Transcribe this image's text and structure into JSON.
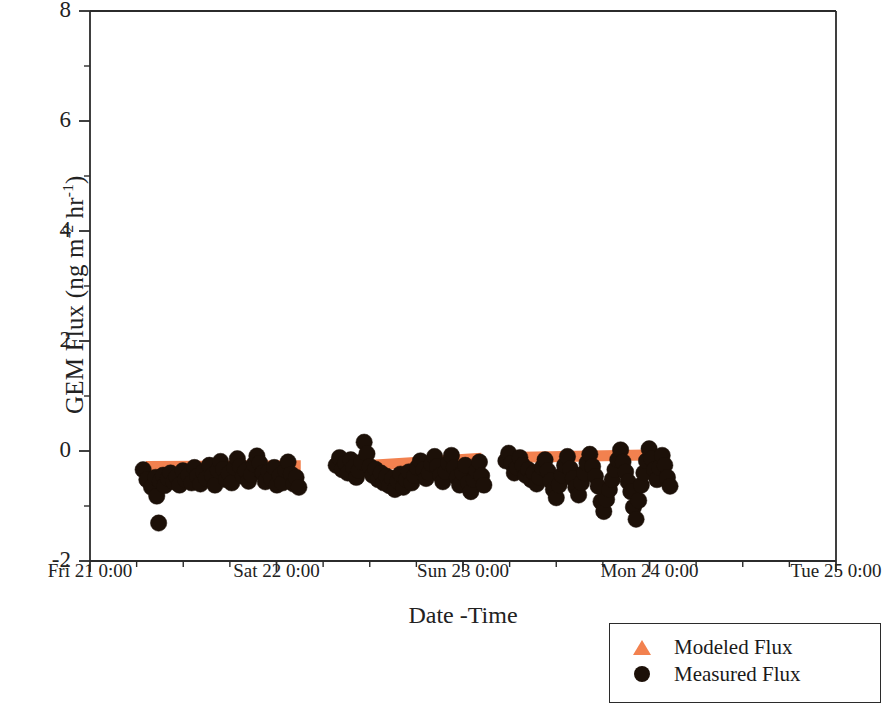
{
  "chart_data": {
    "type": "scatter",
    "title": "",
    "xlabel": "Date -Time",
    "ylabel": "GEM Flux (ng m-2 hr-1)",
    "ylabel_parts": {
      "prefix": "GEM Flux (ng m",
      "sup1": "-2",
      "mid": " hr",
      "sup2": "-1",
      "suffix": ")"
    },
    "ylim": [
      -2,
      8
    ],
    "yticks": [
      8,
      6,
      4,
      2,
      0,
      -2
    ],
    "ytick_labels": [
      "8",
      "6",
      "4",
      "2",
      "0",
      "-2"
    ],
    "xlim": [
      0,
      4
    ],
    "xticks": [
      0,
      1,
      2,
      3,
      4
    ],
    "xtick_labels": [
      "Fri 21 0:00",
      "Sat 22 0:00",
      "Sun 23 0:00",
      "Mon 24 0:00",
      "Tue 25 0:00"
    ],
    "x_minor_ticks_per_interval": 4,
    "grid": false,
    "legend_position": "bottom-right",
    "colors": {
      "modeled": "#F2814F",
      "measured": "#1C1008",
      "axis": "#2b2b2b",
      "background": "#ffffff"
    },
    "series": [
      {
        "name": "Modeled Flux",
        "marker": "triangle",
        "color": "#F2814F",
        "style": "thick-band",
        "segments": [
          {
            "x": [
              0.3,
              1.13
            ],
            "y": [
              -0.28,
              -0.27
            ]
          },
          {
            "x": [
              1.32,
              2.1
            ],
            "y": [
              -0.3,
              -0.13
            ]
          },
          {
            "x": [
              2.23,
              3.05
            ],
            "y": [
              -0.12,
              -0.07
            ]
          }
        ]
      },
      {
        "name": "Measured Flux",
        "marker": "circle",
        "color": "#1C1008",
        "points": [
          [
            0.285,
            -0.34
          ],
          [
            0.305,
            -0.52
          ],
          [
            0.33,
            -0.66
          ],
          [
            0.352,
            -0.48
          ],
          [
            0.358,
            -0.82
          ],
          [
            0.375,
            -0.55
          ],
          [
            0.392,
            -0.44
          ],
          [
            0.4,
            -0.63
          ],
          [
            0.368,
            -1.31
          ],
          [
            0.418,
            -0.5
          ],
          [
            0.432,
            -0.4
          ],
          [
            0.448,
            -0.56
          ],
          [
            0.465,
            -0.47
          ],
          [
            0.48,
            -0.62
          ],
          [
            0.498,
            -0.36
          ],
          [
            0.512,
            -0.52
          ],
          [
            0.528,
            -0.44
          ],
          [
            0.545,
            -0.58
          ],
          [
            0.56,
            -0.3
          ],
          [
            0.575,
            -0.46
          ],
          [
            0.592,
            -0.6
          ],
          [
            0.608,
            -0.38
          ],
          [
            0.622,
            -0.5
          ],
          [
            0.64,
            -0.26
          ],
          [
            0.655,
            -0.45
          ],
          [
            0.67,
            -0.62
          ],
          [
            0.686,
            -0.35
          ],
          [
            0.7,
            -0.19
          ],
          [
            0.715,
            -0.33
          ],
          [
            0.73,
            -0.52
          ],
          [
            0.745,
            -0.41
          ],
          [
            0.76,
            -0.58
          ],
          [
            0.775,
            -0.3
          ],
          [
            0.79,
            -0.14
          ],
          [
            0.805,
            -0.28
          ],
          [
            0.82,
            -0.46
          ],
          [
            0.835,
            -0.36
          ],
          [
            0.85,
            -0.55
          ],
          [
            0.865,
            -0.43
          ],
          [
            0.88,
            -0.24
          ],
          [
            0.895,
            -0.09
          ],
          [
            0.91,
            -0.22
          ],
          [
            0.925,
            -0.4
          ],
          [
            0.94,
            -0.56
          ],
          [
            0.958,
            -0.38
          ],
          [
            0.972,
            -0.5
          ],
          [
            0.988,
            -0.3
          ],
          [
            1.002,
            -0.62
          ],
          [
            1.018,
            -0.45
          ],
          [
            1.032,
            -0.58
          ],
          [
            1.048,
            -0.35
          ],
          [
            1.062,
            -0.2
          ],
          [
            1.078,
            -0.42
          ],
          [
            1.092,
            -0.6
          ],
          [
            1.105,
            -0.48
          ],
          [
            1.12,
            -0.66
          ],
          [
            1.32,
            -0.26
          ],
          [
            1.338,
            -0.12
          ],
          [
            1.352,
            -0.34
          ],
          [
            1.368,
            -0.22
          ],
          [
            1.382,
            -0.4
          ],
          [
            1.398,
            -0.16
          ],
          [
            1.412,
            -0.3
          ],
          [
            1.428,
            -0.48
          ],
          [
            1.442,
            -0.36
          ],
          [
            1.456,
            -0.2
          ],
          [
            1.47,
            0.16
          ],
          [
            1.485,
            -0.05
          ],
          [
            1.5,
            -0.28
          ],
          [
            1.515,
            -0.44
          ],
          [
            1.53,
            -0.33
          ],
          [
            1.545,
            -0.52
          ],
          [
            1.56,
            -0.4
          ],
          [
            1.575,
            -0.58
          ],
          [
            1.59,
            -0.46
          ],
          [
            1.605,
            -0.63
          ],
          [
            1.62,
            -0.5
          ],
          [
            1.635,
            -0.7
          ],
          [
            1.65,
            -0.55
          ],
          [
            1.665,
            -0.42
          ],
          [
            1.68,
            -0.66
          ],
          [
            1.695,
            -0.52
          ],
          [
            1.71,
            -0.38
          ],
          [
            1.725,
            -0.58
          ],
          [
            1.74,
            -0.45
          ],
          [
            1.755,
            -0.3
          ],
          [
            1.772,
            -0.18
          ],
          [
            1.788,
            -0.34
          ],
          [
            1.802,
            -0.5
          ],
          [
            1.818,
            -0.4
          ],
          [
            1.832,
            -0.24
          ],
          [
            1.848,
            -0.1
          ],
          [
            1.862,
            -0.28
          ],
          [
            1.878,
            -0.44
          ],
          [
            1.892,
            -0.56
          ],
          [
            1.908,
            -0.38
          ],
          [
            1.922,
            -0.22
          ],
          [
            1.938,
            -0.08
          ],
          [
            1.952,
            -0.3
          ],
          [
            1.968,
            -0.48
          ],
          [
            1.982,
            -0.62
          ],
          [
            1.998,
            -0.4
          ],
          [
            2.012,
            -0.26
          ],
          [
            2.028,
            -0.58
          ],
          [
            2.042,
            -0.74
          ],
          [
            2.058,
            -0.52
          ],
          [
            2.072,
            -0.36
          ],
          [
            2.088,
            -0.2
          ],
          [
            2.1,
            -0.45
          ],
          [
            2.112,
            -0.62
          ],
          [
            2.23,
            -0.18
          ],
          [
            2.245,
            -0.04
          ],
          [
            2.26,
            -0.22
          ],
          [
            2.275,
            -0.4
          ],
          [
            2.29,
            -0.3
          ],
          [
            2.305,
            -0.12
          ],
          [
            2.32,
            -0.26
          ],
          [
            2.336,
            -0.44
          ],
          [
            2.35,
            -0.34
          ],
          [
            2.365,
            -0.52
          ],
          [
            2.38,
            -0.4
          ],
          [
            2.395,
            -0.6
          ],
          [
            2.41,
            -0.48
          ],
          [
            2.425,
            -0.3
          ],
          [
            2.44,
            -0.16
          ],
          [
            2.455,
            -0.36
          ],
          [
            2.47,
            -0.54
          ],
          [
            2.485,
            -0.7
          ],
          [
            2.5,
            -0.85
          ],
          [
            2.515,
            -0.62
          ],
          [
            2.53,
            -0.44
          ],
          [
            2.545,
            -0.26
          ],
          [
            2.56,
            -0.1
          ],
          [
            2.575,
            -0.32
          ],
          [
            2.59,
            -0.5
          ],
          [
            2.605,
            -0.66
          ],
          [
            2.62,
            -0.8
          ],
          [
            2.635,
            -0.58
          ],
          [
            2.65,
            -0.4
          ],
          [
            2.665,
            -0.22
          ],
          [
            2.68,
            -0.06
          ],
          [
            2.695,
            -0.28
          ],
          [
            2.71,
            -0.46
          ],
          [
            2.725,
            -0.64
          ],
          [
            2.74,
            -0.92
          ],
          [
            2.755,
            -1.1
          ],
          [
            2.77,
            -0.88
          ],
          [
            2.785,
            -0.7
          ],
          [
            2.8,
            -0.52
          ],
          [
            2.815,
            -0.34
          ],
          [
            2.83,
            -0.16
          ],
          [
            2.845,
            0.02
          ],
          [
            2.858,
            -0.2
          ],
          [
            2.872,
            -0.38
          ],
          [
            2.886,
            -0.56
          ],
          [
            2.9,
            -0.74
          ],
          [
            2.914,
            -1.02
          ],
          [
            2.928,
            -1.24
          ],
          [
            2.942,
            -0.9
          ],
          [
            2.956,
            -0.62
          ],
          [
            2.97,
            -0.4
          ],
          [
            2.984,
            -0.18
          ],
          [
            2.998,
            0.04
          ],
          [
            3.012,
            -0.14
          ],
          [
            3.026,
            -0.34
          ],
          [
            3.04,
            -0.52
          ],
          [
            3.054,
            -0.3
          ],
          [
            3.068,
            -0.08
          ],
          [
            3.082,
            -0.26
          ],
          [
            3.096,
            -0.48
          ],
          [
            3.11,
            -0.64
          ]
        ]
      }
    ]
  },
  "legend": {
    "items": [
      {
        "label": "Modeled Flux",
        "marker": "triangle-up",
        "color": "#F2814F"
      },
      {
        "label": "Measured Flux",
        "marker": "filled-circle",
        "color": "#1C1008"
      }
    ]
  }
}
